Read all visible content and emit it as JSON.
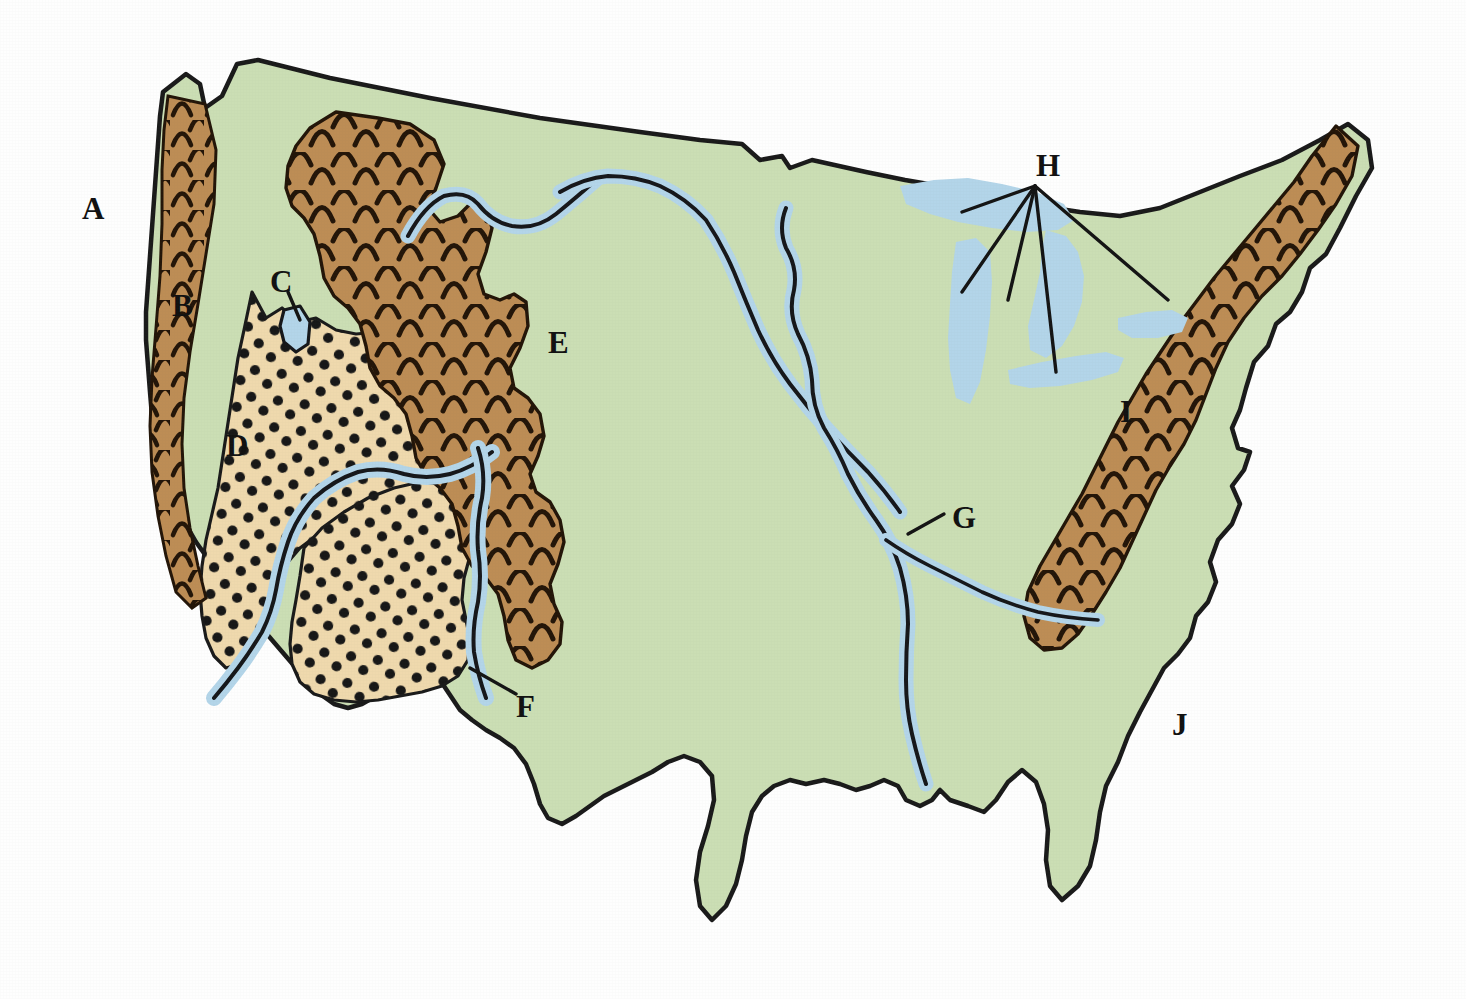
{
  "figure": {
    "kind": "reference-map",
    "region": "contiguous United States",
    "background_color": "#ffffff"
  },
  "palette": {
    "ocean_white": "#ffffff",
    "land_green": "#cbdeb4",
    "mountain_brown": "#bd8d55",
    "plateau_tan": "#efd9ad",
    "water_blue": "#b3d5e9",
    "outline_black": "#1a1a1a",
    "label_black": "#111111"
  },
  "labels": [
    {
      "id": "A",
      "text": "A",
      "x": 82,
      "y": 193,
      "leader": false,
      "refers_to": "pacific-ocean"
    },
    {
      "id": "B",
      "text": "B",
      "x": 172,
      "y": 290,
      "leader": false,
      "refers_to": "coast-ranges"
    },
    {
      "id": "C",
      "text": "C",
      "x": 270,
      "y": 266,
      "leader": true,
      "refers_to": "great-salt-lake"
    },
    {
      "id": "D",
      "text": "D",
      "x": 226,
      "y": 430,
      "leader": false,
      "refers_to": "great-basin"
    },
    {
      "id": "E",
      "text": "E",
      "x": 548,
      "y": 327,
      "leader": false,
      "refers_to": "rocky-mountains"
    },
    {
      "id": "F",
      "text": "F",
      "x": 516,
      "y": 691,
      "leader": true,
      "refers_to": "rio-grande"
    },
    {
      "id": "G",
      "text": "G",
      "x": 952,
      "y": 502,
      "leader": true,
      "refers_to": "mississippi-river"
    },
    {
      "id": "H",
      "text": "H",
      "x": 1036,
      "y": 150,
      "leader": true,
      "refers_to": "great-lakes"
    },
    {
      "id": "I",
      "text": "I",
      "x": 1120,
      "y": 396,
      "leader": false,
      "refers_to": "appalachian-mountains"
    },
    {
      "id": "J",
      "text": "J",
      "x": 1172,
      "y": 709,
      "leader": false,
      "refers_to": "atlantic-ocean"
    }
  ],
  "legend_regions": [
    {
      "name": "lowland-plains",
      "fill": "#cbdeb4",
      "pattern": "solid",
      "description": "green lowland / plains"
    },
    {
      "name": "highland-ranges",
      "fill": "#bd8d55",
      "pattern": "chevrons",
      "description": "brown mountain ranges with arc hachures"
    },
    {
      "name": "basin-plateau",
      "fill": "#efd9ad",
      "pattern": "dots",
      "description": "tan basin and plateau with stipple dots"
    },
    {
      "name": "water-bodies",
      "fill": "#b3d5e9",
      "pattern": "solid",
      "description": "blue rivers and lakes"
    }
  ],
  "features": {
    "mountain_ranges": [
      {
        "name": "coast-ranges-pacific"
      },
      {
        "name": "sierra-nevada"
      },
      {
        "name": "cascade-range"
      },
      {
        "name": "northern-rockies"
      },
      {
        "name": "central-rockies"
      },
      {
        "name": "southern-rockies"
      },
      {
        "name": "appalachian-mountains"
      }
    ],
    "basins": [
      {
        "name": "great-basin"
      },
      {
        "name": "colorado-plateau"
      }
    ],
    "lakes": [
      {
        "name": "great-salt-lake"
      },
      {
        "name": "lake-superior"
      },
      {
        "name": "lake-michigan"
      },
      {
        "name": "lake-huron"
      },
      {
        "name": "lake-erie"
      },
      {
        "name": "lake-ontario"
      }
    ],
    "rivers": [
      {
        "name": "columbia-river"
      },
      {
        "name": "missouri-river"
      },
      {
        "name": "mississippi-river"
      },
      {
        "name": "ohio-river"
      },
      {
        "name": "colorado-river"
      },
      {
        "name": "rio-grande"
      }
    ],
    "oceans": [
      {
        "name": "pacific-ocean"
      },
      {
        "name": "atlantic-ocean"
      },
      {
        "name": "gulf-of-mexico"
      }
    ]
  }
}
